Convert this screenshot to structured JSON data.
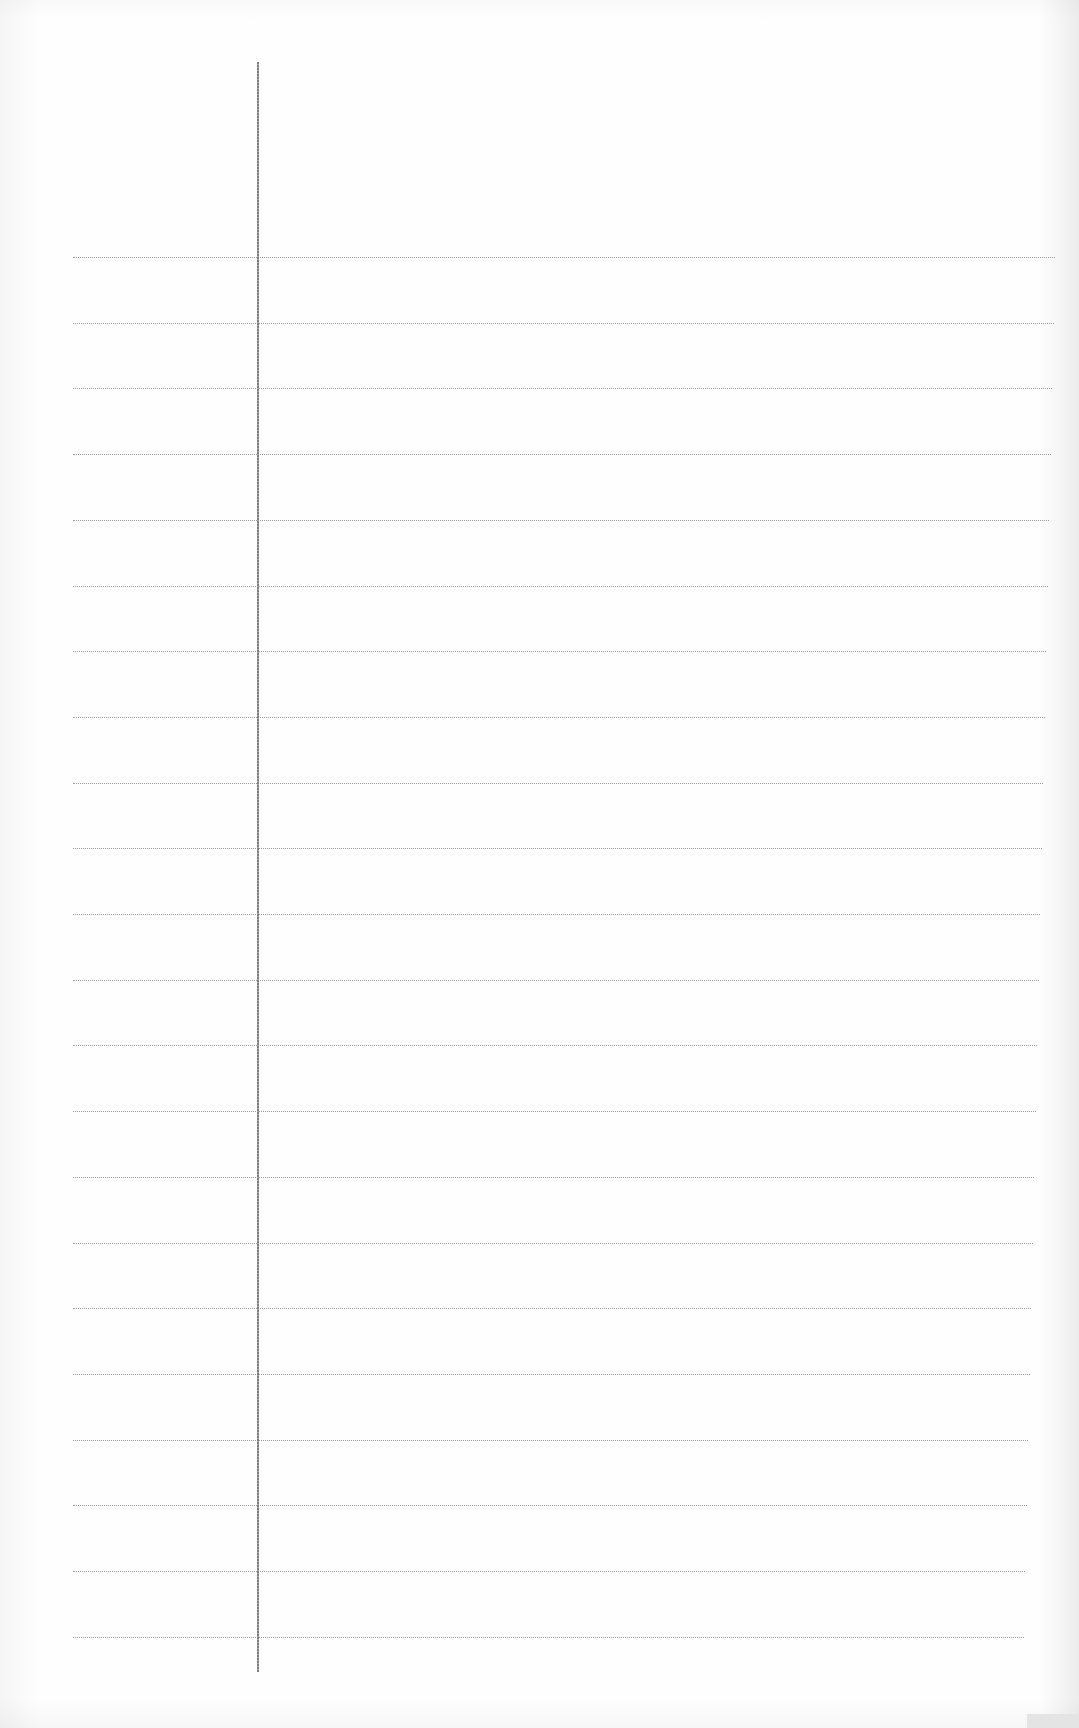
{
  "document": {
    "type": "blank ruled notebook paper",
    "text_content": "",
    "colors": {
      "paper": "#fefefe",
      "rule_line": "#9a9a9a",
      "margin_line": "#7e7e7e",
      "edge_shadow": "#e4e4e4"
    },
    "margin_line": {
      "x": 258,
      "top": 62,
      "bottom": 1672
    },
    "rules": {
      "count": 22,
      "first_y": 257,
      "spacing": 65.7,
      "left_x": 73,
      "right_x_top": 1055,
      "right_x_bottom": 1024
    }
  }
}
